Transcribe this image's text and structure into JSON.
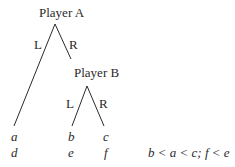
{
  "nodes": {
    "player_a": "Player A",
    "player_b": "Player B"
  },
  "branches": {
    "a_left": "L",
    "a_right": "R",
    "b_left": "L",
    "b_right": "R"
  },
  "payoffs": {
    "row1": [
      "a",
      "b",
      "c"
    ],
    "row2": [
      "d",
      "e",
      "f"
    ]
  },
  "condition": "b < a < c; f < e",
  "colors": {
    "line": "#2a2a2a",
    "background": "#ffffff"
  }
}
